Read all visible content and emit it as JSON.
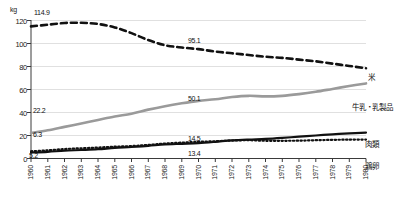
{
  "chart_data": {
    "type": "line",
    "title": "",
    "xlabel": "",
    "ylabel": "kg",
    "unit": "kg",
    "xlim": [
      1960,
      1980
    ],
    "ylim": [
      0,
      120
    ],
    "yticks": [
      0,
      20,
      40,
      60,
      80,
      100,
      120
    ],
    "grid": true,
    "legend_position": "right-inline",
    "categories": [
      1960,
      1961,
      1962,
      1963,
      1964,
      1965,
      1966,
      1967,
      1968,
      1969,
      1970,
      1971,
      1972,
      1973,
      1974,
      1975,
      1976,
      1977,
      1978,
      1979,
      1980
    ],
    "series": [
      {
        "name": "米",
        "style": "dashed",
        "color": "#111111",
        "values": [
          114.9,
          116.3,
          117.8,
          118.0,
          117.0,
          114.0,
          109.0,
          103.0,
          98.5,
          96.5,
          95.1,
          93.0,
          91.5,
          90.0,
          88.5,
          87.5,
          86.0,
          84.5,
          82.5,
          80.5,
          78.5
        ]
      },
      {
        "name": "牛乳・乳製品",
        "style": "solid",
        "color": "#9a9a9a",
        "values": [
          22.2,
          24.5,
          27.5,
          30.5,
          33.5,
          36.5,
          39.0,
          42.5,
          45.5,
          48.0,
          50.1,
          51.5,
          53.5,
          54.5,
          54.0,
          54.5,
          56.0,
          58.0,
          60.5,
          63.0,
          65.3
        ]
      },
      {
        "name": "肉類",
        "style": "solid",
        "color": "#111111",
        "values": [
          5.2,
          5.8,
          6.8,
          7.4,
          8.1,
          9.2,
          10.0,
          11.0,
          12.2,
          12.8,
          13.4,
          14.5,
          15.8,
          16.5,
          17.0,
          17.9,
          19.0,
          20.0,
          21.0,
          21.8,
          22.5
        ]
      },
      {
        "name": "鶏卵",
        "style": "dotted",
        "color": "#111111",
        "values": [
          6.3,
          7.1,
          8.2,
          8.9,
          9.5,
          10.3,
          10.8,
          11.8,
          13.0,
          13.8,
          14.5,
          15.0,
          15.6,
          15.9,
          15.4,
          15.4,
          15.5,
          15.9,
          16.2,
          16.4,
          16.5
        ]
      }
    ],
    "point_labels": [
      {
        "series": "米",
        "year": 1960,
        "value": "114.9"
      },
      {
        "series": "米",
        "year": 1970,
        "value": "95.1"
      },
      {
        "series": "牛乳・乳製品",
        "year": 1960,
        "value": "22.2"
      },
      {
        "series": "牛乳・乳製品",
        "year": 1970,
        "value": "50.1"
      },
      {
        "series": "鶏卵",
        "year": 1960,
        "value": "6.3"
      },
      {
        "series": "鶏卵",
        "year": 1970,
        "value": "14.5"
      },
      {
        "series": "肉類",
        "year": 1960,
        "value": "5.2"
      },
      {
        "series": "肉類",
        "year": 1970,
        "value": "13.4"
      }
    ]
  },
  "axis": {
    "unit_label": "kg",
    "yticks": [
      "120",
      "100",
      "80",
      "60",
      "40",
      "20",
      "0"
    ],
    "xticks": [
      "1960",
      "1961",
      "1962",
      "1963",
      "1964",
      "1965",
      "1966",
      "1967",
      "1968",
      "1969",
      "1970",
      "1971",
      "1972",
      "1973",
      "1974",
      "1975",
      "1976",
      "1977",
      "1978",
      "1979",
      "1980"
    ]
  },
  "labels": {
    "rice_start": "114.9",
    "rice_mid": "95.1",
    "dairy_start": "22.2",
    "dairy_mid": "50.1",
    "eggs_start": "6.3",
    "eggs_mid": "14.5",
    "meat_start": "5.2",
    "meat_mid": "13.4"
  },
  "legend": {
    "rice": "米",
    "dairy": "牛乳・乳製品",
    "meat": "肉類",
    "eggs": "鶏卵"
  },
  "colors": {
    "rice": "#111111",
    "dairy": "#9a9a9a",
    "meat": "#111111",
    "eggs": "#111111",
    "grid": "#d8d8d8",
    "axis": "#4a4a4a"
  }
}
